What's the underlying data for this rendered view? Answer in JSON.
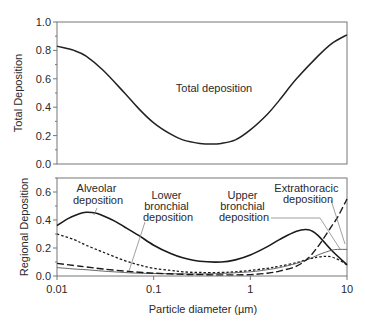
{
  "chart_data": [
    {
      "type": "line",
      "title": "",
      "xlabel": "",
      "ylabel": "Total Deposition",
      "xscale": "log",
      "xlim": [
        0.01,
        10
      ],
      "ylim": [
        0.0,
        1.0
      ],
      "yticks": [
        0.0,
        0.2,
        0.4,
        0.6,
        0.8,
        1.0
      ],
      "ytick_labels": [
        "0.0",
        "0.2",
        "0.4",
        "0.6",
        "0.8",
        "1.0"
      ],
      "grid": false,
      "annotations": [
        {
          "text": "Total deposition",
          "x": 0.35,
          "y": 0.62
        }
      ],
      "series": [
        {
          "name": "Total deposition",
          "style": "solid",
          "x": [
            0.01,
            0.015,
            0.02,
            0.03,
            0.05,
            0.07,
            0.1,
            0.15,
            0.2,
            0.3,
            0.4,
            0.5,
            0.7,
            1.0,
            1.5,
            2.0,
            3.0,
            5.0,
            7.0,
            10.0
          ],
          "y": [
            0.83,
            0.8,
            0.76,
            0.66,
            0.5,
            0.39,
            0.29,
            0.21,
            0.17,
            0.145,
            0.14,
            0.145,
            0.17,
            0.24,
            0.35,
            0.45,
            0.6,
            0.76,
            0.85,
            0.91
          ]
        }
      ]
    },
    {
      "type": "line",
      "title": "",
      "xlabel": "Particle diameter  (µm)",
      "ylabel": "Regional Deposition",
      "xscale": "log",
      "xlim": [
        0.01,
        10
      ],
      "ylim": [
        0.0,
        0.7
      ],
      "xticks": [
        0.01,
        0.1,
        1,
        10
      ],
      "xtick_labels": [
        "0.01",
        "0.1",
        "1",
        "10"
      ],
      "yticks": [
        0.0,
        0.2,
        0.4,
        0.6
      ],
      "ytick_labels": [
        "0.0",
        "0.2",
        "0.4",
        "0.6"
      ],
      "grid": false,
      "annotations": [
        {
          "text": "Alveolar deposition",
          "lines": [
            "Alveolar",
            "deposition"
          ]
        },
        {
          "text": "Lower bronchial deposition",
          "lines": [
            "Lower",
            "bronchial",
            "deposition"
          ]
        },
        {
          "text": "Upper bronchial deposition",
          "lines": [
            "Upper",
            "bronchial",
            "deposition"
          ]
        },
        {
          "text": "Extrathoracic deposition",
          "lines": [
            "Extrathoracic",
            "deposition"
          ]
        }
      ],
      "series": [
        {
          "name": "Alveolar deposition",
          "style": "solid-thick",
          "x": [
            0.01,
            0.013,
            0.017,
            0.02,
            0.025,
            0.03,
            0.04,
            0.05,
            0.07,
            0.1,
            0.15,
            0.2,
            0.3,
            0.5,
            0.7,
            1.0,
            1.5,
            2.0,
            3.0,
            4.0,
            5.0,
            7.0,
            10.0
          ],
          "y": [
            0.36,
            0.41,
            0.445,
            0.455,
            0.45,
            0.43,
            0.39,
            0.35,
            0.29,
            0.22,
            0.16,
            0.13,
            0.105,
            0.1,
            0.115,
            0.15,
            0.21,
            0.26,
            0.32,
            0.33,
            0.29,
            0.18,
            0.08
          ]
        },
        {
          "name": "Lower bronchial deposition",
          "style": "short-dash",
          "x": [
            0.01,
            0.015,
            0.02,
            0.03,
            0.05,
            0.07,
            0.1,
            0.15,
            0.2,
            0.3,
            0.5,
            0.7,
            1.0,
            1.5,
            2.0,
            3.0,
            4.0,
            5.0,
            6.0,
            7.0,
            8.5,
            10.0
          ],
          "y": [
            0.3,
            0.26,
            0.22,
            0.17,
            0.11,
            0.08,
            0.055,
            0.04,
            0.03,
            0.025,
            0.025,
            0.03,
            0.04,
            0.055,
            0.07,
            0.095,
            0.12,
            0.135,
            0.14,
            0.135,
            0.11,
            0.08
          ]
        },
        {
          "name": "Upper bronchial deposition",
          "style": "solid-thin",
          "x": [
            0.01,
            0.015,
            0.02,
            0.03,
            0.05,
            0.07,
            0.1,
            0.2,
            0.3,
            0.5,
            1.0,
            1.5,
            2.0,
            3.0,
            4.0,
            5.0,
            6.0,
            7.0,
            8.0,
            10.0
          ],
          "y": [
            0.06,
            0.05,
            0.045,
            0.035,
            0.025,
            0.02,
            0.018,
            0.015,
            0.015,
            0.018,
            0.03,
            0.045,
            0.06,
            0.09,
            0.12,
            0.15,
            0.17,
            0.185,
            0.19,
            0.19
          ]
        },
        {
          "name": "Extrathoracic deposition",
          "style": "long-dash",
          "x": [
            0.01,
            0.015,
            0.02,
            0.03,
            0.05,
            0.07,
            0.1,
            0.2,
            0.3,
            0.5,
            1.0,
            1.5,
            2.0,
            3.0,
            4.0,
            5.0,
            6.0,
            7.0,
            8.0,
            10.0
          ],
          "y": [
            0.09,
            0.075,
            0.065,
            0.05,
            0.035,
            0.027,
            0.02,
            0.012,
            0.01,
            0.008,
            0.01,
            0.02,
            0.035,
            0.07,
            0.13,
            0.21,
            0.29,
            0.36,
            0.42,
            0.55
          ]
        }
      ]
    }
  ],
  "labels": {
    "top_ylabel": "Total Deposition",
    "bottom_ylabel": "Regional Deposition",
    "xlabel": "Particle diameter  (µm)",
    "total_annotation": "Total deposition",
    "alveolar": [
      "Alveolar",
      "deposition"
    ],
    "lower_bronchial": [
      "Lower",
      "bronchial",
      "deposition"
    ],
    "upper_bronchial": [
      "Upper",
      "bronchial",
      "deposition"
    ],
    "extrathoracic": [
      "Extrathoracic",
      "deposition"
    ]
  }
}
